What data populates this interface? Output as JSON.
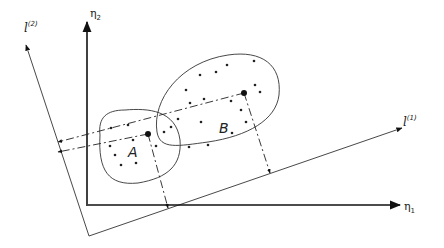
{
  "diagram": {
    "axes": {
      "eta1": {
        "label": "η",
        "subscript": "1",
        "from": [
          88,
          205
        ],
        "to": [
          400,
          205
        ],
        "label_pos": [
          404,
          210
        ]
      },
      "eta2": {
        "label": "η",
        "subscript": "2",
        "from": [
          87,
          206
        ],
        "to": [
          87,
          22
        ],
        "label_pos": [
          90,
          17
        ]
      },
      "l1": {
        "label": "l",
        "superscript": "(1)",
        "from": [
          89,
          236
        ],
        "to": [
          402,
          128
        ],
        "label_pos": [
          403,
          126
        ]
      },
      "l2": {
        "label": "l",
        "superscript": "(2)",
        "from": [
          89,
          236
        ],
        "to": [
          26,
          45
        ],
        "label_pos": [
          24,
          32
        ]
      }
    },
    "clusters": [
      {
        "name": "A",
        "label_pos": [
          128,
          157
        ],
        "centroid": [
          148,
          134
        ],
        "boundary": "M 100 135 C 98 118, 106 110, 125 110 C 148 108, 176 110, 180 140 C 182 165, 168 178, 138 183 C 108 186, 98 170, 100 135 Z",
        "points": [
          [
            111,
            128
          ],
          [
            128,
            125
          ],
          [
            133,
            140
          ],
          [
            110,
            146
          ],
          [
            156,
            146
          ],
          [
            121,
            165
          ],
          [
            136,
            163
          ],
          [
            115,
            155
          ],
          [
            164,
            132
          ]
        ],
        "projection_l1": [
          168,
          208
        ],
        "projection_l2": [
          58,
          152
        ]
      },
      {
        "name": "B",
        "label_pos": [
          219,
          133
        ],
        "centroid": [
          244,
          93
        ],
        "boundary": "M 157 132 C 152 100, 180 62, 228 55 C 262 50, 282 65, 279 95 C 276 120, 248 136, 208 142 C 178 146, 160 150, 157 132 Z",
        "points": [
          [
            200,
            75
          ],
          [
            216,
            72
          ],
          [
            227,
            65
          ],
          [
            254,
            61
          ],
          [
            186,
            90
          ],
          [
            190,
            103
          ],
          [
            204,
            99
          ],
          [
            231,
            101
          ],
          [
            255,
            85
          ],
          [
            260,
            92
          ],
          [
            171,
            127
          ],
          [
            178,
            119
          ],
          [
            201,
            122
          ],
          [
            241,
            110
          ],
          [
            189,
            147
          ],
          [
            208,
            145
          ],
          [
            232,
            133
          ],
          [
            246,
            122
          ]
        ],
        "projection_l1": [
          270,
          173
        ],
        "projection_l2": [
          58,
          142
        ]
      }
    ]
  }
}
